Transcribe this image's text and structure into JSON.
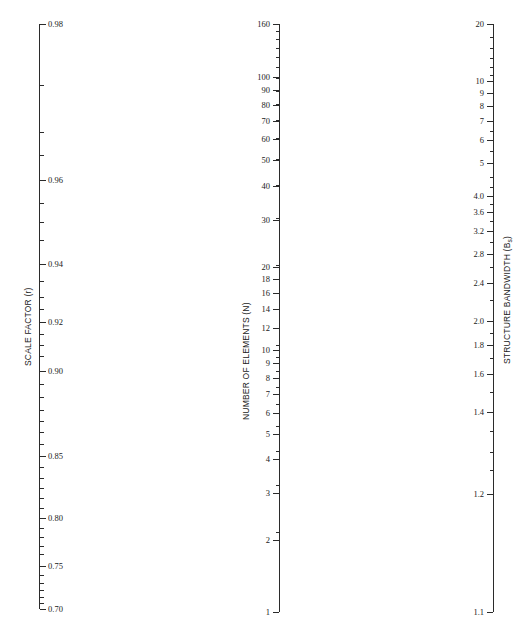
{
  "figure": {
    "type": "nomogram",
    "background_color": "#ffffff",
    "line_color": "#2b2b2b",
    "width": 518,
    "height": 628
  },
  "chart_data": {
    "type": "line",
    "title": "",
    "subtitle": "",
    "xlabel": "",
    "ylabel": "",
    "grid": false,
    "legend": "none",
    "axes": [
      {
        "id": "scale-factor",
        "title": "SCALE FACTOR (r)",
        "symbol": "r",
        "position": "left",
        "label_side": "right",
        "tick_side": "right",
        "range": [
          0.7,
          0.98
        ],
        "top_value": "0.98",
        "bottom_value": "0.70",
        "scale": "nonlinear-log",
        "x_px": 39,
        "top_px": 24,
        "bottom_px": 609,
        "major_ticks": [
          {
            "label": "0.98",
            "value": 0.98,
            "y_px": 24
          },
          {
            "label": "0.96",
            "value": 0.96,
            "y_px": 180
          },
          {
            "label": "0.94",
            "value": 0.94,
            "y_px": 264
          },
          {
            "label": "0.92",
            "value": 0.92,
            "y_px": 322
          },
          {
            "label": "0.90",
            "value": 0.9,
            "y_px": 371
          },
          {
            "label": "0.85",
            "value": 0.85,
            "y_px": 456
          },
          {
            "label": "0.80",
            "value": 0.8,
            "y_px": 518
          },
          {
            "label": "0.75",
            "value": 0.75,
            "y_px": 566
          },
          {
            "label": "0.70",
            "value": 0.7,
            "y_px": 609
          }
        ],
        "minor_ticks_y_px": [
          85,
          132,
          155,
          203,
          222,
          240,
          281,
          297,
          309,
          334,
          345,
          356,
          384,
          397,
          410,
          421,
          432,
          444,
          467,
          478,
          488,
          498,
          508,
          528,
          537,
          546,
          554,
          575,
          583,
          590,
          597,
          603
        ]
      },
      {
        "id": "number-of-elements",
        "title": "NUMBER OF ELEMENTS (N)",
        "symbol": "N",
        "position": "center",
        "label_side": "left",
        "tick_side": "left",
        "range": [
          1,
          160
        ],
        "top_value": "160",
        "bottom_value": "1",
        "scale": "log10",
        "x_px": 279,
        "top_px": 24,
        "bottom_px": 612,
        "major_ticks": [
          {
            "label": "160",
            "value": 160,
            "y_px": 24
          },
          {
            "label": "100",
            "value": 100,
            "y_px": 77
          },
          {
            "label": "90",
            "value": 90,
            "y_px": 90
          },
          {
            "label": "80",
            "value": 80,
            "y_px": 105
          },
          {
            "label": "70",
            "value": 70,
            "y_px": 121
          },
          {
            "label": "60",
            "value": 60,
            "y_px": 139
          },
          {
            "label": "50",
            "value": 50,
            "y_px": 160
          },
          {
            "label": "40",
            "value": 40,
            "y_px": 186
          },
          {
            "label": "30",
            "value": 30,
            "y_px": 220
          },
          {
            "label": "20",
            "value": 20,
            "y_px": 267
          },
          {
            "label": "18",
            "value": 18,
            "y_px": 279
          },
          {
            "label": "16",
            "value": 16,
            "y_px": 293
          },
          {
            "label": "14",
            "value": 14,
            "y_px": 309
          },
          {
            "label": "12",
            "value": 12,
            "y_px": 328
          },
          {
            "label": "10",
            "value": 10,
            "y_px": 350
          },
          {
            "label": "9",
            "value": 9,
            "y_px": 363
          },
          {
            "label": "8",
            "value": 8,
            "y_px": 378
          },
          {
            "label": "7",
            "value": 7,
            "y_px": 394
          },
          {
            "label": "6",
            "value": 6,
            "y_px": 413
          },
          {
            "label": "5",
            "value": 5,
            "y_px": 434
          },
          {
            "label": "4",
            "value": 4,
            "y_px": 459
          },
          {
            "label": "3",
            "value": 3,
            "y_px": 493
          },
          {
            "label": "2",
            "value": 2,
            "y_px": 540
          },
          {
            "label": "1",
            "value": 1,
            "y_px": 612
          }
        ]
      },
      {
        "id": "structure-bandwidth",
        "title": "STRUCTURE BANDWIDTH (B",
        "title_sub": "s",
        "title_suffix": ")",
        "symbol": "Bs",
        "position": "right",
        "label_side": "left",
        "tick_side": "left",
        "range": [
          1.1,
          20
        ],
        "top_value": "20",
        "bottom_value": "1.1",
        "scale": "log-offset",
        "x_px": 493,
        "top_px": 24,
        "bottom_px": 612,
        "major_ticks": [
          {
            "label": "20",
            "value": 20,
            "y_px": 24
          },
          {
            "label": "10",
            "value": 10,
            "y_px": 81
          },
          {
            "label": "9",
            "value": 9,
            "y_px": 93
          },
          {
            "label": "8",
            "value": 8,
            "y_px": 106
          },
          {
            "label": "7",
            "value": 7,
            "y_px": 121
          },
          {
            "label": "6",
            "value": 6,
            "y_px": 140
          },
          {
            "label": "5",
            "value": 5,
            "y_px": 163
          },
          {
            "label": "4.0",
            "value": 4.0,
            "y_px": 196
          },
          {
            "label": "3.6",
            "value": 3.6,
            "y_px": 212
          },
          {
            "label": "3.2",
            "value": 3.2,
            "y_px": 231
          },
          {
            "label": "2.8",
            "value": 2.8,
            "y_px": 254
          },
          {
            "label": "2.4",
            "value": 2.4,
            "y_px": 283
          },
          {
            "label": "2.0",
            "value": 2.0,
            "y_px": 321
          },
          {
            "label": "1.8",
            "value": 1.8,
            "y_px": 345
          },
          {
            "label": "1.6",
            "value": 1.6,
            "y_px": 374
          },
          {
            "label": "1.4",
            "value": 1.4,
            "y_px": 412
          },
          {
            "label": "1.2",
            "value": 1.2,
            "y_px": 494
          },
          {
            "label": "1.1",
            "value": 1.1,
            "y_px": 612
          }
        ],
        "minor_ticks_y_px": [
          37,
          48,
          58,
          67,
          75,
          131,
          151,
          177,
          187,
          204,
          221,
          242,
          267,
          300,
          333,
          358,
          392,
          431,
          452,
          470
        ]
      }
    ]
  }
}
